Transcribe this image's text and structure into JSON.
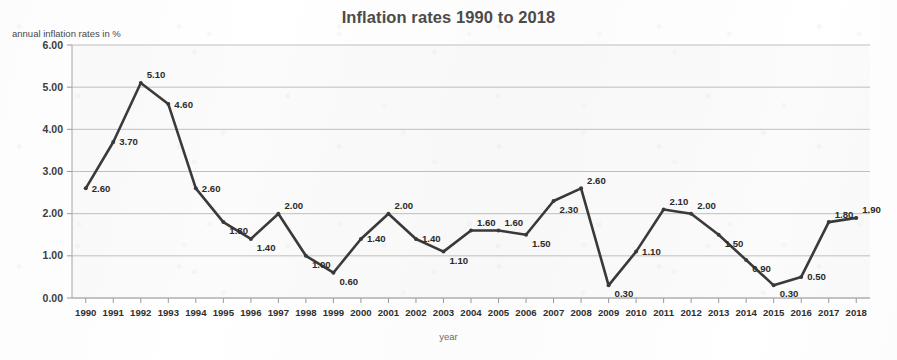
{
  "chart_data": {
    "type": "line",
    "title": "Inflation rates 1990 to 2018",
    "xlabel": "year",
    "ylabel": "annual inflation rates in %",
    "categories": [
      "1990",
      "1991",
      "1992",
      "1993",
      "1994",
      "1995",
      "1996",
      "1997",
      "1998",
      "1999",
      "2000",
      "2001",
      "2002",
      "2003",
      "2004",
      "2005",
      "2006",
      "2007",
      "2008",
      "2009",
      "2010",
      "2011",
      "2012",
      "2013",
      "2014",
      "2015",
      "2016",
      "2017",
      "2018"
    ],
    "values": [
      2.6,
      3.7,
      5.1,
      4.6,
      2.6,
      1.8,
      1.4,
      2.0,
      1.0,
      0.6,
      1.4,
      2.0,
      1.4,
      1.1,
      1.6,
      1.6,
      1.5,
      2.3,
      2.6,
      0.3,
      1.1,
      2.1,
      2.0,
      1.5,
      0.9,
      0.3,
      0.5,
      1.8,
      1.9
    ],
    "data_labels": [
      "2.60",
      "3.70",
      "5.10",
      "4.60",
      "2.60",
      "1.80",
      "1.40",
      "2.00",
      "1.00",
      "0.60",
      "1.40",
      "2.00",
      "1.40",
      "1.10",
      "1.60",
      "1.60",
      "1.50",
      "2.30",
      "2.60",
      "0.30",
      "1.10",
      "2.10",
      "2.00",
      "1.50",
      "0.90",
      "0.30",
      "0.50",
      "1.80",
      "1.90"
    ],
    "ylim": [
      0.0,
      6.0
    ],
    "ytick_values": [
      0.0,
      1.0,
      2.0,
      3.0,
      4.0,
      5.0,
      6.0
    ],
    "ytick_labels": [
      "0.00",
      "1.00",
      "2.00",
      "3.00",
      "4.00",
      "5.00",
      "6.00"
    ],
    "grid": true,
    "legend": false,
    "series_color": "#3a3a3a",
    "gridline_color": "#b9b9b9",
    "title_color": "#4c4c4c"
  }
}
